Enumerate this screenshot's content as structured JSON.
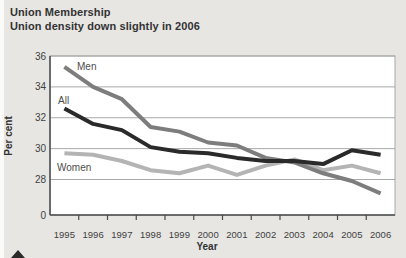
{
  "header": {
    "title": "Union Membership",
    "subtitle": "Union density down slightly in 2006"
  },
  "chart_data": {
    "type": "line",
    "title": "Union Membership",
    "subtitle": "Union density down slightly in 2006",
    "xlabel": "Year",
    "ylabel": "Per cent",
    "categories": [
      "1995",
      "1996",
      "1997",
      "1998",
      "1999",
      "2000",
      "2001",
      "2002",
      "2003",
      "2004",
      "2005",
      "2006"
    ],
    "series": [
      {
        "name": "Women",
        "color": "#b4b4b4",
        "values": [
          29.7,
          29.6,
          29.2,
          28.6,
          28.4,
          28.9,
          28.3,
          28.9,
          29.3,
          28.6,
          28.9,
          28.4
        ]
      },
      {
        "name": "Men",
        "color": "#7d7d7d",
        "values": [
          35.3,
          34.0,
          33.2,
          31.4,
          31.1,
          30.4,
          30.2,
          29.4,
          29.1,
          28.4,
          27.9,
          27.1
        ]
      },
      {
        "name": "All",
        "color": "#2a2a2a",
        "values": [
          32.6,
          31.6,
          31.2,
          30.1,
          29.8,
          29.7,
          29.4,
          29.2,
          29.2,
          29.0,
          29.9,
          29.6
        ]
      }
    ],
    "series_label_positions": {
      "Men": {
        "x": 77,
        "y": 70
      },
      "All": {
        "x": 58,
        "y": 104
      },
      "Women": {
        "x": 57,
        "y": 171
      }
    },
    "y_ticks": [
      {
        "label": "36",
        "value": 36
      },
      {
        "label": "34",
        "value": 34
      },
      {
        "label": "32",
        "value": 32
      },
      {
        "label": "30",
        "value": 30
      },
      {
        "label": "28",
        "value": 28
      },
      {
        "label": "0",
        "value": "axis-base"
      }
    ],
    "axis_break": true,
    "grid": true,
    "legend_position": "inline-labels",
    "ylim_display": "0, then 28 to 36"
  },
  "colors": {
    "background": "#e7e6e3",
    "plot_background": "#ffffff",
    "gridline": "#a8a8a8",
    "axis": "#4a4a4a",
    "text": "#333333",
    "tick_text": "#3f3f3f",
    "series_men": "#7d7d7d",
    "series_all": "#2a2a2a",
    "series_women": "#b4b4b4"
  }
}
